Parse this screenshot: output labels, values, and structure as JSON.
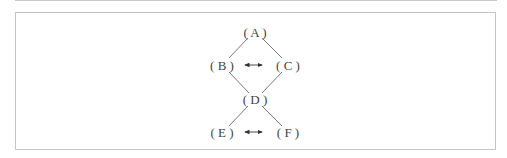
{
  "diagram": {
    "type": "lattice",
    "nodes": [
      {
        "id": "A",
        "label": "( A )",
        "x": 255,
        "y": 33
      },
      {
        "id": "B",
        "label": "( B )",
        "x": 222,
        "y": 66
      },
      {
        "id": "C",
        "label": "( C )",
        "x": 288,
        "y": 66
      },
      {
        "id": "D",
        "label": "( D )",
        "x": 255,
        "y": 100
      },
      {
        "id": "E",
        "label": "( E )",
        "x": 222,
        "y": 133
      },
      {
        "id": "F",
        "label": "( F )",
        "x": 288,
        "y": 133
      }
    ],
    "edges": [
      {
        "from": "A",
        "to": "B"
      },
      {
        "from": "A",
        "to": "C"
      },
      {
        "from": "B",
        "to": "D"
      },
      {
        "from": "C",
        "to": "D"
      },
      {
        "from": "D",
        "to": "E"
      },
      {
        "from": "D",
        "to": "F"
      }
    ],
    "bidirectional_arrows": [
      {
        "between": [
          "B",
          "C"
        ]
      },
      {
        "between": [
          "E",
          "F"
        ]
      }
    ],
    "colors": {
      "text": "#444444",
      "line": "#555555",
      "frame": "#c4c4c4"
    }
  }
}
